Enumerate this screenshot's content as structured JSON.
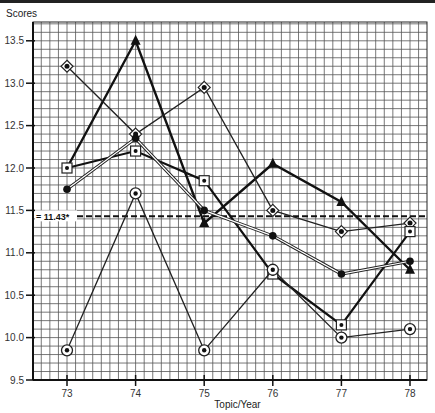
{
  "chart_data": {
    "type": "line",
    "title": "",
    "xlabel": "Topic/Year",
    "ylabel": "Scores",
    "x": [
      73,
      74,
      75,
      76,
      77,
      78
    ],
    "ylim": [
      9.5,
      13.7
    ],
    "yticks": [
      9.5,
      10.0,
      10.5,
      11.0,
      11.5,
      12.0,
      12.5,
      13.0,
      13.5
    ],
    "ytick_labels": [
      "9.5",
      "10.0",
      "10.5",
      "11.0",
      "11.5",
      "12.0",
      "12.5",
      "13.0",
      "13.5"
    ],
    "xtick_labels": [
      "73",
      "74",
      "75",
      "76",
      "77",
      "78"
    ],
    "grid": true,
    "legend": null,
    "reference_line": {
      "value": 11.43,
      "label": "11.43*",
      "style": "dashed"
    },
    "series": [
      {
        "name": "Series A (filled triangle)",
        "marker": "triangle",
        "line": "bold",
        "values": [
          12.0,
          13.5,
          11.35,
          12.05,
          11.6,
          10.8
        ]
      },
      {
        "name": "Series B (diamond)",
        "marker": "diamond",
        "line": "thin",
        "values": [
          13.2,
          12.4,
          12.95,
          11.5,
          11.25,
          11.35
        ]
      },
      {
        "name": "Series C (square)",
        "marker": "square",
        "line": "thick",
        "values": [
          12.0,
          12.2,
          11.85,
          10.75,
          10.15,
          11.25
        ]
      },
      {
        "name": "Series D (filled dot)",
        "marker": "dot",
        "line": "double",
        "values": [
          11.75,
          12.35,
          11.5,
          11.2,
          10.75,
          10.9
        ]
      },
      {
        "name": "Series E (circled dot)",
        "marker": "circle-dot",
        "line": "thin",
        "values": [
          9.85,
          11.7,
          9.85,
          10.8,
          10.0,
          10.1
        ]
      }
    ]
  },
  "labels": {
    "y_title": "Scores",
    "x_title": "Topic/Year"
  }
}
